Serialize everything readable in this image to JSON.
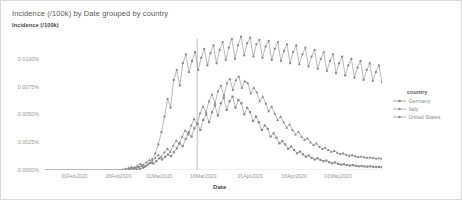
{
  "chart_data": {
    "type": "line",
    "title": "Incidence (/100k) by Date grouped by country",
    "xlabel": "Date",
    "ylabel": "Incidence (/100k)",
    "ylim": [
      0,
      0.0125
    ],
    "grid": false,
    "legend_position": "right",
    "legend_title": "country",
    "ytick_labels": [
      "0.0100%",
      "0.0075%",
      "0.0050%",
      "0.0025%",
      "0.0000%"
    ],
    "ytick_values": [
      0.01,
      0.0075,
      0.005,
      0.0025,
      0.0
    ],
    "xtick_labels": [
      "01Feb2020",
      "16Feb2020",
      "01Mar2020",
      "16Mar2020",
      "01Apr2020",
      "16Apr2020",
      "01May2020"
    ],
    "x_start": "22Jan2020",
    "x_end": "12May2020",
    "series": [
      {
        "name": "Germany",
        "color": "#8a8a8a",
        "marker": "square",
        "values": [
          0,
          0,
          0,
          0,
          0,
          0,
          0,
          0,
          0,
          0,
          0,
          0,
          0,
          0,
          0,
          0,
          0,
          0,
          0,
          0,
          0,
          0,
          0,
          0,
          0,
          0,
          0,
          2e-05,
          4e-05,
          8e-05,
          0.00012,
          0.00018,
          0.00026,
          0.00035,
          0.0003,
          0.00048,
          0.00062,
          0.00058,
          0.0008,
          0.00105,
          0.00095,
          0.00118,
          0.0014,
          0.00125,
          0.0016,
          0.00195,
          0.0024,
          0.00215,
          0.0028,
          0.0034,
          0.003,
          0.00375,
          0.0042,
          0.0036,
          0.0045,
          0.005,
          0.0043,
          0.0052,
          0.0058,
          0.0049,
          0.006,
          0.0065,
          0.0054,
          0.0062,
          0.0066,
          0.0056,
          0.0063,
          0.006,
          0.005,
          0.0056,
          0.0052,
          0.0044,
          0.0048,
          0.0043,
          0.0036,
          0.004,
          0.0037,
          0.003,
          0.0033,
          0.0029,
          0.0024,
          0.0026,
          0.0023,
          0.0019,
          0.0021,
          0.0018,
          0.0015,
          0.00165,
          0.0014,
          0.0012,
          0.0013,
          0.0011,
          0.00095,
          0.00105,
          0.0009,
          0.0008,
          0.00085,
          0.0007,
          0.0006,
          0.00068,
          0.00055,
          0.00048,
          0.00052,
          0.00045,
          0.0004,
          0.00044,
          0.00038,
          0.00034,
          0.00036,
          0.00032,
          0.0003,
          0.00033,
          0.00029,
          0.00027,
          0.00028,
          0.00026
        ]
      },
      {
        "name": "Italy",
        "color": "#8a8a8a",
        "marker": "triangle",
        "values": [
          0,
          0,
          0,
          0,
          0,
          0,
          0,
          0,
          0,
          0,
          0,
          0,
          0,
          0,
          0,
          0,
          0,
          0,
          0,
          0,
          0,
          0,
          0,
          0,
          0,
          2e-05,
          5e-05,
          0.0001,
          0.00018,
          0.00028,
          0.00022,
          0.0004,
          0.00055,
          0.00048,
          0.0007,
          0.0009,
          0.00075,
          0.0011,
          0.00135,
          0.0012,
          0.0016,
          0.0019,
          0.00165,
          0.0022,
          0.00265,
          0.0024,
          0.003,
          0.00355,
          0.0032,
          0.004,
          0.0046,
          0.00415,
          0.0051,
          0.0057,
          0.0052,
          0.0062,
          0.0068,
          0.006,
          0.0071,
          0.0076,
          0.0067,
          0.0078,
          0.0082,
          0.0072,
          0.0081,
          0.0084,
          0.0074,
          0.008,
          0.0078,
          0.0069,
          0.0074,
          0.007,
          0.0062,
          0.0066,
          0.006,
          0.0053,
          0.0057,
          0.0051,
          0.0045,
          0.0048,
          0.0043,
          0.0038,
          0.0041,
          0.0036,
          0.0032,
          0.00345,
          0.003,
          0.0027,
          0.00285,
          0.0025,
          0.00225,
          0.0024,
          0.0021,
          0.0019,
          0.002,
          0.0018,
          0.00165,
          0.00172,
          0.00155,
          0.00145,
          0.0015,
          0.00138,
          0.0013,
          0.00134,
          0.00125,
          0.00118,
          0.00122,
          0.00115,
          0.0011,
          0.00113,
          0.00108,
          0.00104,
          0.00106,
          0.00102
        ]
      },
      {
        "name": "United States",
        "color": "#8a8a8a",
        "marker": "circle",
        "values": [
          0,
          0,
          0,
          0,
          0,
          0,
          0,
          0,
          0,
          0,
          0,
          0,
          0,
          0,
          0,
          0,
          0,
          0,
          0,
          0,
          0,
          0,
          0,
          0,
          0,
          0,
          0,
          0,
          0,
          2e-05,
          5e-05,
          0.0001,
          0.0002,
          0.00035,
          0.0006,
          0.00095,
          0.0015,
          0.0023,
          0.0034,
          0.0048,
          0.0064,
          0.0056,
          0.0081,
          0.009,
          0.0076,
          0.0096,
          0.0104,
          0.0088,
          0.0098,
          0.0106,
          0.009,
          0.0101,
          0.0109,
          0.0094,
          0.0105,
          0.0112,
          0.0096,
          0.0108,
          0.0115,
          0.0099,
          0.011,
          0.0118,
          0.01,
          0.0112,
          0.012,
          0.0103,
          0.0114,
          0.0119,
          0.0102,
          0.0113,
          0.0117,
          0.0101,
          0.0111,
          0.0116,
          0.0099,
          0.0109,
          0.0115,
          0.0098,
          0.0107,
          0.0113,
          0.0096,
          0.0106,
          0.0112,
          0.0095,
          0.0104,
          0.011,
          0.0093,
          0.0102,
          0.0108,
          0.0091,
          0.01,
          0.0106,
          0.0089,
          0.0098,
          0.0104,
          0.0087,
          0.0096,
          0.0102,
          0.0085,
          0.0094,
          0.01,
          0.0083,
          0.0092,
          0.0098,
          0.0081,
          0.009,
          0.0096,
          0.008,
          0.0088,
          0.0094,
          0.0079
        ]
      }
    ]
  }
}
